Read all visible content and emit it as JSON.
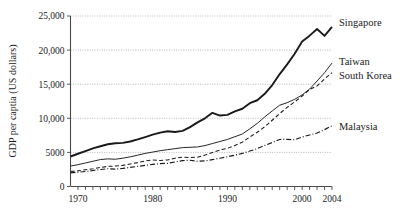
{
  "chart_data": {
    "type": "line",
    "title": "",
    "xlabel": "",
    "ylabel": "GDP per captia (US dollars)",
    "xlim": [
      1969,
      2004
    ],
    "ylim": [
      0,
      25000
    ],
    "grid": true,
    "legend_position": "right-inline-labels",
    "y_ticks": [
      0,
      5000,
      10000,
      15000,
      20000,
      25000
    ],
    "y_tick_labels": [
      "0",
      "5000",
      "10,000",
      "15,000",
      "20,000",
      "25,000"
    ],
    "x_ticks": [
      1970,
      1980,
      1990,
      2000,
      2004
    ],
    "x_tick_labels": [
      "1970",
      "1980",
      "1990",
      "2000",
      "2004"
    ],
    "x_minor_tick_interval": 1,
    "x": [
      1969,
      1970,
      1971,
      1972,
      1973,
      1974,
      1975,
      1976,
      1977,
      1978,
      1979,
      1980,
      1981,
      1982,
      1983,
      1984,
      1985,
      1986,
      1987,
      1988,
      1989,
      1990,
      1991,
      1992,
      1993,
      1994,
      1995,
      1996,
      1997,
      1998,
      1999,
      2000,
      2001,
      2002,
      2003,
      2004
    ],
    "series": [
      {
        "name": "Singapore",
        "line_style": "solid-thick",
        "color": "#1a1a1a",
        "values": [
          4400,
          4800,
          5200,
          5600,
          5900,
          6200,
          6350,
          6400,
          6600,
          6900,
          7250,
          7600,
          7900,
          8100,
          8000,
          8150,
          8700,
          9400,
          10000,
          10800,
          10400,
          10500,
          11000,
          11400,
          12100,
          12400,
          13200,
          14300,
          15700,
          16900,
          18200,
          19700,
          20300,
          21000,
          19900,
          20900
        ]
      },
      {
        "name": "Taiwan",
        "line_style": "solid-thin",
        "color": "#1a1a1a",
        "values": [
          3000,
          3200,
          3450,
          3700,
          3950,
          4050,
          4000,
          4150,
          4350,
          4600,
          4850,
          5050,
          5250,
          5400,
          5550,
          5700,
          5750,
          5800,
          6000,
          6300,
          6600,
          6900,
          7300,
          7700,
          8100,
          8500,
          9000,
          9400,
          9750,
          9700,
          9750,
          9900,
          10200,
          10700,
          11200,
          11800
        ]
      },
      {
        "name": "South Korea",
        "line_style": "dashed",
        "color": "#1a1a1a",
        "values": [
          2200,
          2300,
          2450,
          2600,
          2800,
          2950,
          3000,
          3100,
          3300,
          3500,
          3750,
          3900,
          3800,
          3900,
          4150,
          4300,
          4250,
          4300,
          4600,
          5000,
          5350,
          5600,
          6000,
          6500,
          7100,
          7600,
          8200,
          8900,
          9600,
          10200,
          10700,
          11200,
          11800,
          12000,
          12600,
          13100
        ]
      },
      {
        "name": "Malaysia",
        "line_style": "dash-dot",
        "color": "#1a1a1a",
        "values": [
          2000,
          2100,
          2200,
          2350,
          2500,
          2600,
          2550,
          2650,
          2800,
          2950,
          3100,
          3250,
          3350,
          3400,
          3600,
          3800,
          3850,
          3700,
          3750,
          3950,
          4150,
          4350,
          4600,
          4850,
          5100,
          5350,
          5700,
          6000,
          6300,
          6200,
          6050,
          6300,
          6450,
          6600,
          6900,
          7250
        ]
      }
    ],
    "series_end_labels": [
      {
        "name": "Singapore",
        "value_2004": 23400
      },
      {
        "name": "Taiwan",
        "value_2004": 18100
      },
      {
        "name": "South Korea",
        "value_2004": 16700
      },
      {
        "name": "Malaysia",
        "value_2004": 8900
      }
    ]
  }
}
